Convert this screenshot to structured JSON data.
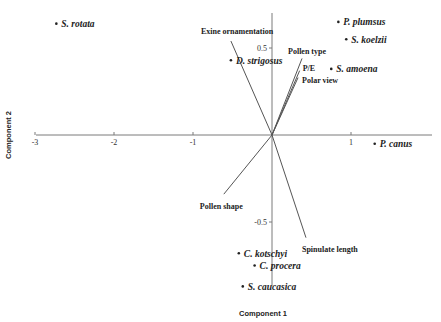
{
  "chart_data": {
    "type": "scatter",
    "title": "",
    "xlabel": "Component 1",
    "ylabel": "Component 2",
    "xlim": [
      -3,
      2.0
    ],
    "ylim": [
      -0.87,
      0.7
    ],
    "grid": false,
    "x_ticks": [
      {
        "value": -3,
        "label": "-3"
      },
      {
        "value": -2,
        "label": "-2"
      },
      {
        "value": -1,
        "label": "-1"
      },
      {
        "value": 1,
        "label": "1"
      }
    ],
    "y_ticks": [
      {
        "value": 0.5,
        "label": "0.5"
      },
      {
        "value": -0.5,
        "label": "-0.5"
      }
    ],
    "points": [
      {
        "label": "S. rotata",
        "x": -2.73,
        "y": 0.64
      },
      {
        "label": "P. plumsus",
        "x": 0.84,
        "y": 0.65
      },
      {
        "label": "S. koelzii",
        "x": 0.94,
        "y": 0.55
      },
      {
        "label": "D. strigosus",
        "x": -0.52,
        "y": 0.43
      },
      {
        "label": "S. amoena",
        "x": 0.75,
        "y": 0.38
      },
      {
        "label": "P. canus",
        "x": 1.3,
        "y": -0.05
      },
      {
        "label": "C. kotschyi",
        "x": -0.42,
        "y": -0.68
      },
      {
        "label": "C. procera",
        "x": -0.22,
        "y": -0.75
      },
      {
        "label": "S. caucasica",
        "x": -0.37,
        "y": -0.87
      }
    ],
    "vectors": [
      {
        "label": "Exine ornamentation",
        "x": -0.52,
        "y": 0.54
      },
      {
        "label": "Pollen type",
        "x": 0.38,
        "y": 0.44
      },
      {
        "label": "P/E",
        "x": 0.35,
        "y": 0.37
      },
      {
        "label": "Polar view",
        "x": 0.33,
        "y": 0.33
      },
      {
        "label": "Pollen shape",
        "x": -0.61,
        "y": -0.34
      },
      {
        "label": "Spinulate length",
        "x": 0.43,
        "y": -0.59
      }
    ]
  }
}
